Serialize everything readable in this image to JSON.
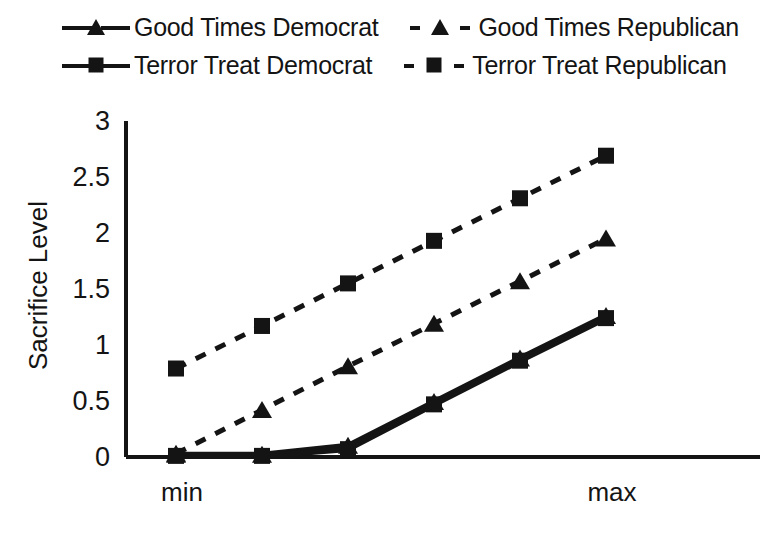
{
  "chart_data": {
    "type": "line",
    "title": "",
    "xlabel": "",
    "ylabel": "Sacrifice Level",
    "x": [
      1,
      2,
      3,
      4,
      5,
      6
    ],
    "xtick_labels": [
      "min",
      "max"
    ],
    "xtick_positions": [
      1,
      6
    ],
    "ytick_labels": [
      "0",
      "0.5",
      "1",
      "1.5",
      "2",
      "2.5",
      "3"
    ],
    "ytick_values": [
      0,
      0.5,
      1,
      1.5,
      2,
      2.5,
      3
    ],
    "ylim": [
      0,
      3
    ],
    "grid": false,
    "legend_position": "top",
    "series": [
      {
        "name": "Good Times Democrat",
        "marker": "triangle",
        "linestyle": "solid",
        "color": "#141414",
        "values": [
          0.02,
          0.02,
          0.1,
          0.49,
          0.88,
          1.26
        ]
      },
      {
        "name": "Good Times Republican",
        "marker": "triangle",
        "linestyle": "dashed",
        "color": "#141414",
        "values": [
          0.03,
          0.42,
          0.81,
          1.19,
          1.57,
          1.95
        ]
      },
      {
        "name": "Terror Treat Democrat",
        "marker": "square",
        "linestyle": "solid",
        "color": "#141414",
        "values": [
          0.01,
          0.01,
          0.07,
          0.47,
          0.86,
          1.24
        ]
      },
      {
        "name": "Terror Treat Republican",
        "marker": "square",
        "linestyle": "dashed",
        "color": "#141414",
        "values": [
          0.79,
          1.17,
          1.55,
          1.93,
          2.31,
          2.69
        ]
      }
    ]
  },
  "legend": {
    "rows": [
      [
        {
          "label": "Good Times Democrat",
          "marker": "triangle",
          "linestyle": "solid"
        },
        {
          "label": "Good Times Republican",
          "marker": "triangle",
          "linestyle": "dashed"
        }
      ],
      [
        {
          "label": "Terror Treat Democrat",
          "marker": "square",
          "linestyle": "solid"
        },
        {
          "label": "Terror Treat Republican",
          "marker": "square",
          "linestyle": "dashed"
        }
      ]
    ]
  }
}
